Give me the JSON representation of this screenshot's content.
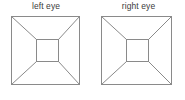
{
  "canvas": {
    "width": 185,
    "height": 100,
    "background": "#ffffff"
  },
  "style": {
    "line_color": "#8a8a8a",
    "line_width": 1,
    "label_color": "#3b3b3b",
    "label_font_size": 8.5
  },
  "figures": [
    {
      "id": "left-eye",
      "label": "left eye",
      "outer_square": {
        "x": 11,
        "y": 16,
        "width": 69,
        "height": 69
      },
      "inner_square": {
        "x": 36,
        "y": 39,
        "width": 23,
        "height": 23
      },
      "diagonals": [
        {
          "from": "outer-top-left",
          "to": "inner-top-left"
        },
        {
          "from": "outer-top-right",
          "to": "inner-top-right"
        },
        {
          "from": "outer-bottom-right",
          "to": "inner-bottom-right"
        },
        {
          "from": "outer-bottom-left",
          "to": "inner-bottom-left"
        }
      ]
    },
    {
      "id": "right-eye",
      "label": "right eye",
      "outer_square": {
        "x": 101,
        "y": 16,
        "width": 71,
        "height": 69
      },
      "inner_square": {
        "x": 126,
        "y": 39,
        "width": 23,
        "height": 23
      },
      "diagonals": [
        {
          "from": "outer-top-left",
          "to": "inner-top-left"
        },
        {
          "from": "outer-top-right",
          "to": "inner-top-right"
        },
        {
          "from": "outer-bottom-right",
          "to": "inner-bottom-right"
        },
        {
          "from": "outer-bottom-left",
          "to": "inner-bottom-left"
        }
      ]
    }
  ]
}
